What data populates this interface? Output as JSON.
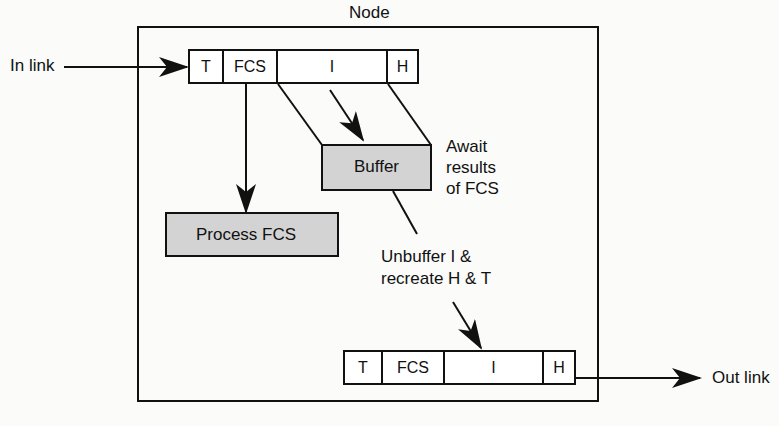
{
  "diagram": {
    "title": "Node",
    "in_link_label": "In link",
    "out_link_label": "Out link",
    "input_frame": {
      "fields": [
        "T",
        "FCS",
        "I",
        "H"
      ]
    },
    "output_frame": {
      "fields": [
        "T",
        "FCS",
        "I",
        "H"
      ]
    },
    "buffer_label": "Buffer",
    "process_label": "Process FCS",
    "await_note": [
      "Await",
      "results",
      "of FCS"
    ],
    "unbuffer_note": [
      "Unbuffer I &",
      "recreate H & T"
    ],
    "colors": {
      "line": "#111111",
      "box_fill": "#d3d3d3",
      "background": "#fbfbfa"
    }
  }
}
